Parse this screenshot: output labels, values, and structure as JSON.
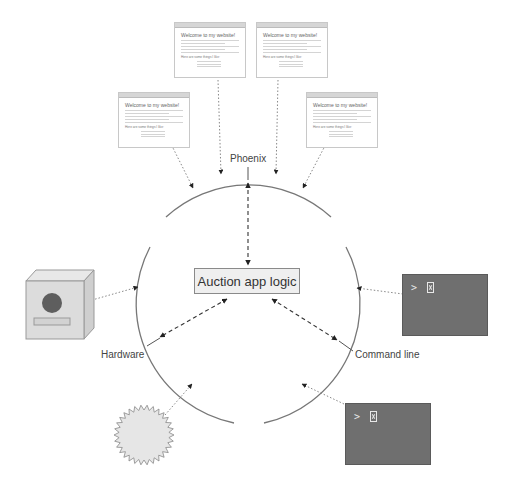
{
  "core": {
    "label": "Auction app logic"
  },
  "interfaces": {
    "top": "Phoenix",
    "left": "Hardware",
    "right": "Command line"
  },
  "browsers": [
    {
      "heading": "Welcome to my website!",
      "subheading": "Here are some things I like:"
    },
    {
      "heading": "Welcome to my website!",
      "subheading": "Here are some things I like:"
    },
    {
      "heading": "Welcome to my website!",
      "subheading": "Here are some things I like:"
    },
    {
      "heading": "Welcome to my website!",
      "subheading": "Here are some things I like:"
    }
  ],
  "terminals": [
    {
      "prompt": ">",
      "cursor": "cursor-icon"
    },
    {
      "prompt": ">",
      "cursor": "cursor-icon"
    }
  ],
  "devices": [
    {
      "icon": "hardware-box-icon"
    },
    {
      "icon": "sensor-starburst-icon"
    }
  ],
  "colors": {
    "circle": "#777777",
    "terminal_bg": "#6f6f6f",
    "core_bg": "#efefef",
    "hardware_face": "#dcdcdc",
    "hardware_circle": "#5e5e5e",
    "starburst_fill": "#e6e6e6"
  }
}
